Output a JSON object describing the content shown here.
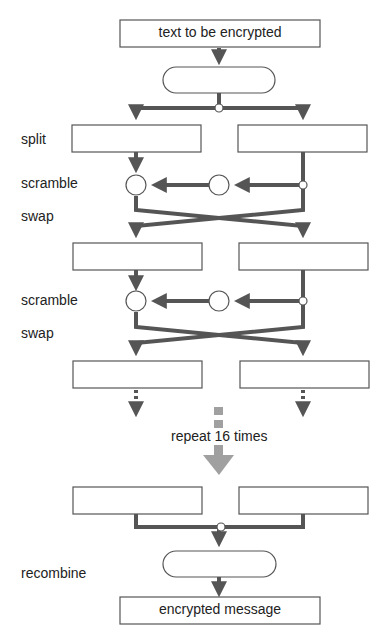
{
  "input_box": {
    "label": "text to be encrypted"
  },
  "output_box": {
    "label": "encrypted message"
  },
  "step_labels": {
    "split": "split",
    "scramble1": "scramble",
    "swap1": "swap",
    "scramble2": "scramble",
    "swap2": "swap",
    "recombine": "recombine"
  },
  "repeat": {
    "label": "repeat 16 times",
    "count": 16
  },
  "colors": {
    "line": "#555555",
    "repeat_arrow": "#a0a0a0",
    "box_border": "#555555",
    "background": "#ffffff"
  }
}
